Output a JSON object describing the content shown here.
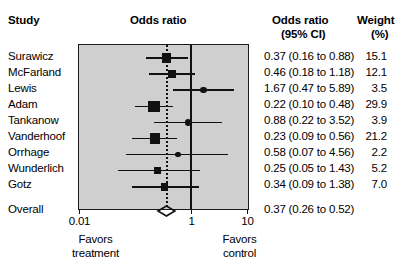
{
  "headers": {
    "study": "Study",
    "plot_title": "Odds ratio",
    "or_line1": "Odds ratio",
    "or_line2": "(95% CI)",
    "weight_line1": "Weight",
    "weight_line2": "(%)"
  },
  "axis": {
    "ticks": [
      {
        "value": 0.01,
        "label": "0.01"
      },
      {
        "value": 1,
        "label": "1"
      },
      {
        "value": 10,
        "label": "10"
      }
    ],
    "min": 0.01,
    "max": 10,
    "scale": "log",
    "null_value": 1,
    "left_foot_line1": "Favors",
    "left_foot_line2": "treatment",
    "right_foot_line1": "Favors",
    "right_foot_line2": "control"
  },
  "colors": {
    "plot_background": "#cfcfcf",
    "marker": "#111111",
    "axis": "#111111",
    "page_background": "#ffffff"
  },
  "chart_data": {
    "type": "forest",
    "title": "Odds ratio",
    "xlabel": "",
    "ylabel": "",
    "xscale": "log",
    "xlim": [
      0.01,
      10
    ],
    "xticks": [
      0.01,
      1,
      10
    ],
    "null_line": 1,
    "grid": false,
    "legend": "none",
    "columns": [
      "Study",
      "Odds ratio (95% CI)",
      "Weight (%)"
    ],
    "studies": [
      {
        "name": "Surawicz",
        "or": 0.37,
        "lo": 0.16,
        "hi": 0.88,
        "weight": 15.1,
        "or_text": "0.37 (0.16 to 0.88)",
        "weight_text": "15.1"
      },
      {
        "name": "McFarland",
        "or": 0.46,
        "lo": 0.18,
        "hi": 1.18,
        "weight": 12.1,
        "or_text": "0.46 (0.18 to 1.18)",
        "weight_text": "12.1"
      },
      {
        "name": "Lewis",
        "or": 1.67,
        "lo": 0.47,
        "hi": 5.89,
        "weight": 3.5,
        "or_text": "1.67 (0.47 to 5.89)",
        "weight_text": "3.5"
      },
      {
        "name": "Adam",
        "or": 0.22,
        "lo": 0.1,
        "hi": 0.48,
        "weight": 29.9,
        "or_text": "0.22 (0.10 to 0.48)",
        "weight_text": "29.9"
      },
      {
        "name": "Tankanow",
        "or": 0.88,
        "lo": 0.22,
        "hi": 3.52,
        "weight": 3.9,
        "or_text": "0.88 (0.22 to 3.52)",
        "weight_text": "3.9"
      },
      {
        "name": "Vanderhoof",
        "or": 0.23,
        "lo": 0.09,
        "hi": 0.56,
        "weight": 21.2,
        "or_text": "0.23 (0.09 to 0.56)",
        "weight_text": "21.2"
      },
      {
        "name": "Orrhage",
        "or": 0.58,
        "lo": 0.07,
        "hi": 4.56,
        "weight": 2.2,
        "or_text": "0.58 (0.07 to 4.56)",
        "weight_text": "2.2"
      },
      {
        "name": "Wunderlich",
        "or": 0.25,
        "lo": 0.05,
        "hi": 1.43,
        "weight": 5.2,
        "or_text": "0.25 (0.05 to 1.43)",
        "weight_text": "5.2"
      },
      {
        "name": "Gotz",
        "or": 0.34,
        "lo": 0.09,
        "hi": 1.38,
        "weight": 7.0,
        "or_text": "0.34 (0.09 to 1.38)",
        "weight_text": "7.0"
      }
    ],
    "overall": {
      "name": "Overall",
      "or": 0.37,
      "lo": 0.26,
      "hi": 0.52,
      "or_text": "0.37 (0.26 to 0.52)",
      "weight_text": ""
    }
  }
}
